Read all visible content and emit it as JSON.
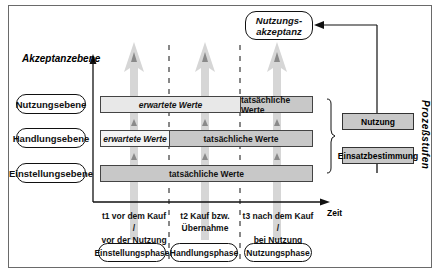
{
  "diagram": {
    "y_axis_label": "Akzeptanzebene",
    "x_axis_label": "Zeit",
    "side_label": "Prozeßstufen",
    "outcome": "Nutzungs-\nakzeptanz",
    "outcome_lines": [
      "Nutzungs-",
      "akzeptanz"
    ],
    "levels": [
      {
        "label": "Nutzungsebene",
        "segments": [
          {
            "text": "erwartete Werte",
            "style": "light-italic"
          },
          {
            "text": "tatsächliche Werte",
            "style": "dark"
          }
        ]
      },
      {
        "label": "Handlungsebene",
        "segments": [
          {
            "text": "erwartete Werte",
            "style": "light-italic"
          },
          {
            "text": "tatsächliche Werte",
            "style": "dark"
          }
        ]
      },
      {
        "label": "Einstellungsebene",
        "segments": [
          {
            "text": "tatsächliche Werte",
            "style": "dark"
          }
        ]
      }
    ],
    "time_points": [
      {
        "line1": "t1 vor dem Kauf /",
        "line2": "vor der Nutzung"
      },
      {
        "line1": "t2 Kauf bzw.",
        "line2": "Übernahme"
      },
      {
        "line1": "t3 nach dem Kauf /",
        "line2": "bei Nutzung"
      }
    ],
    "phases": [
      "Einstellungsphase",
      "Handlungsphase",
      "Nutzungsphase"
    ],
    "process_steps": [
      "Nutzung",
      "Einsatzbestimmung"
    ],
    "colors": {
      "dark_fill": "#c8c8c8",
      "light_fill": "#f4f4f4",
      "arrow": "#c4c4c4",
      "line": "#111111"
    }
  }
}
